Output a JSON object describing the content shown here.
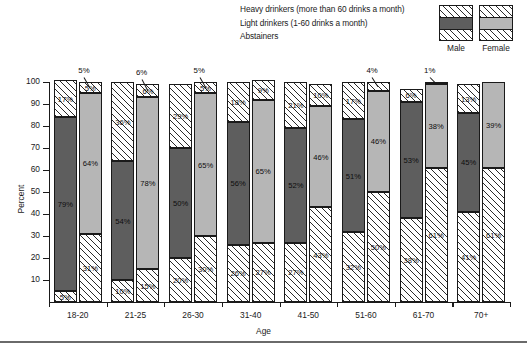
{
  "legend": {
    "entries": [
      "Heavy drinkers (more than 60 drinks a month)",
      "Light drinkers (1-60 drinks a month)",
      "Abstainers"
    ],
    "series_labels": [
      "Male",
      "Female"
    ],
    "male_swatches": [
      "hatch",
      "dark",
      "hatch"
    ],
    "female_swatches": [
      "hatch",
      "light",
      "hatch"
    ]
  },
  "axes": {
    "ylabel": "Percent",
    "xlabel": "Age",
    "yticks": [
      "100",
      "90",
      "80",
      "70",
      "60",
      "50",
      "40",
      "30",
      "20",
      "10"
    ],
    "ylim": [
      0,
      100
    ]
  },
  "colors": {
    "male_light_drinkers": "#5e5e5e",
    "female_light_drinkers": "#b6b6b6",
    "hatch_stroke": "#2a2a2a",
    "axis": "#1a1a1a",
    "background": "#ffffff"
  },
  "chart_data": {
    "type": "bar",
    "title": "",
    "subtitle": "",
    "xlabel": "Age",
    "ylabel": "Percent",
    "ylim": [
      0,
      100
    ],
    "grid": false,
    "stacked": true,
    "legend_position": "top-right",
    "categories": [
      "18-20",
      "21-25",
      "26-30",
      "31-40",
      "41-50",
      "51-60",
      "61-70",
      "70+"
    ],
    "groups": [
      "Male",
      "Female"
    ],
    "series": [
      {
        "name": "Abstainers",
        "group": "Male",
        "fill": "hatch",
        "values": [
          5,
          10,
          20,
          26,
          27,
          32,
          38,
          41
        ],
        "labels": [
          "5%",
          "10%",
          "20%",
          "26%",
          "27%",
          "32%",
          "38%",
          "41%"
        ]
      },
      {
        "name": "Light drinkers (1-60 drinks a month)",
        "group": "Male",
        "fill": "dark",
        "values": [
          79,
          54,
          50,
          56,
          52,
          51,
          53,
          45
        ],
        "labels": [
          "79%",
          "54%",
          "50%",
          "56%",
          "52%",
          "51%",
          "53%",
          "45%"
        ]
      },
      {
        "name": "Heavy drinkers (more than 60 drinks a month)",
        "group": "Male",
        "fill": "hatch",
        "values": [
          17,
          36,
          29,
          18,
          21,
          17,
          6,
          13
        ],
        "labels": [
          "17%",
          "36%",
          "29%",
          "18%",
          "21%",
          "17%",
          "6%",
          "13%"
        ]
      },
      {
        "name": "Abstainers",
        "group": "Female",
        "fill": "hatch",
        "values": [
          31,
          15,
          30,
          27,
          43,
          50,
          61,
          61
        ],
        "labels": [
          "31%",
          "15%",
          "30%",
          "27%",
          "43%",
          "50%",
          "61%",
          "61%"
        ]
      },
      {
        "name": "Light drinkers (1-60 drinks a month)",
        "group": "Female",
        "fill": "light",
        "values": [
          64,
          78,
          65,
          65,
          46,
          46,
          38,
          39
        ],
        "labels": [
          "64%",
          "78%",
          "65%",
          "65%",
          "46%",
          "46%",
          "38%",
          "39%"
        ]
      },
      {
        "name": "Heavy drinkers (more than 60 drinks a month)",
        "group": "Female",
        "fill": "hatch",
        "values": [
          5,
          6,
          5,
          9,
          10,
          4,
          1,
          0
        ],
        "labels": [
          "5%",
          "6%",
          "5%",
          "9%",
          "10%",
          "4%",
          "1%",
          ""
        ]
      }
    ],
    "callouts": [
      {
        "category": "18-20",
        "group": "Female",
        "text": "5%"
      },
      {
        "category": "21-25",
        "group": "Female",
        "text": "6%"
      },
      {
        "category": "26-30",
        "group": "Female",
        "text": "5%"
      },
      {
        "category": "51-60",
        "group": "Female",
        "text": "4%"
      },
      {
        "category": "61-70",
        "group": "Female",
        "text": "1%"
      }
    ]
  }
}
